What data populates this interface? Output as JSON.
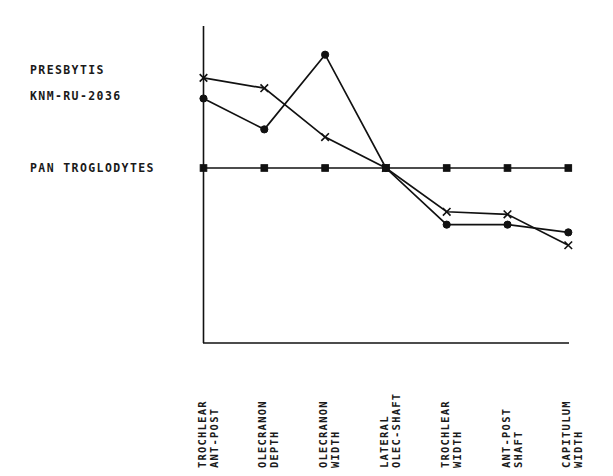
{
  "figure": {
    "background": "#ffffff",
    "ink_color": "#111111"
  },
  "legend": {
    "taxon_line1": "PRESBYTIS",
    "taxon_line2": "KNM-RU-2036",
    "baseline_taxon": "PAN TROGLODYTES"
  },
  "chart_data": {
    "type": "line",
    "title": "",
    "xlabel": "",
    "ylabel": "",
    "grid": false,
    "legend_position": "left-inside",
    "categories": [
      "TROCHLEAR ANT-POST",
      "OLECRANON DEPTH",
      "OLECRANON WIDTH",
      "LATERAL OLEC-SHAFT",
      "TROCHLEAR WIDTH",
      "ANT-POST SHAFT",
      "CAPITULUM WIDTH"
    ],
    "category_lines": [
      [
        "TROCHLEAR",
        "ANT-POST"
      ],
      [
        "OLECRANON",
        "DEPTH"
      ],
      [
        "OLECRANON",
        "WIDTH"
      ],
      [
        "LATERAL",
        "OLEC-SHAFT"
      ],
      [
        "TROCHLEAR",
        "WIDTH"
      ],
      [
        "ANT-POST",
        "SHAFT"
      ],
      [
        "CAPITULUM",
        "WIDTH"
      ]
    ],
    "ylim": [
      -1.3,
      2.6
    ],
    "series": [
      {
        "name": "PAN TROGLODYTES",
        "marker": "square",
        "role": "baseline",
        "values": [
          0,
          0,
          0,
          0,
          0,
          0,
          0
        ]
      },
      {
        "name": "PRESBYTIS",
        "marker": "x",
        "values": [
          1.75,
          1.55,
          0.6,
          0.0,
          -0.85,
          -0.9,
          -1.5
        ]
      },
      {
        "name": "KNM-RU-2036",
        "marker": "circle",
        "values": [
          1.35,
          0.75,
          2.2,
          0.0,
          -1.1,
          -1.1,
          -1.25
        ]
      }
    ]
  }
}
